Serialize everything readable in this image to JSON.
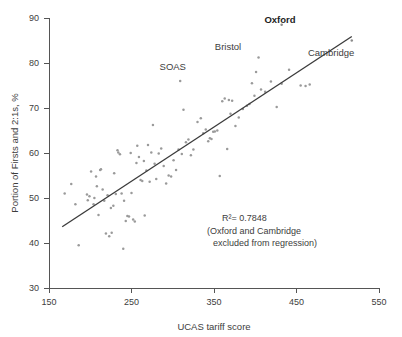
{
  "chart_data": {
    "type": "scatter",
    "title": "",
    "xlabel": "UCAS tariff score",
    "ylabel": "Portion of Firsts and 2:1s, %",
    "xlim": [
      150,
      550
    ],
    "ylim": [
      30,
      90
    ],
    "xticks": [
      150,
      250,
      350,
      450,
      550
    ],
    "yticks": [
      30,
      40,
      50,
      60,
      70,
      80,
      90
    ],
    "grid": false,
    "legend_position": "none",
    "annotations": [
      {
        "name": "r-squared",
        "text": "R²= 0.7848"
      },
      {
        "name": "exclusion-note-line1",
        "text": "(Oxford and Cambridge"
      },
      {
        "name": "exclusion-note-line2",
        "text": "excluded from regression)"
      }
    ],
    "point_labels": [
      {
        "name": "SOAS",
        "bold": false,
        "x": 300,
        "y": 78.5
      },
      {
        "name": "Bristol",
        "bold": false,
        "x": 367,
        "y": 83.0
      },
      {
        "name": "Oxford",
        "bold": true,
        "x": 430,
        "y": 89.0
      },
      {
        "name": "Cambridge",
        "bold": false,
        "x": 492,
        "y": 81.5
      }
    ],
    "regression_line": {
      "x_start": 166,
      "y_start": 43.6,
      "x_end": 517,
      "y_end": 85.9,
      "note": "Oxford and Cambridge excluded from regression"
    },
    "series": [
      {
        "name": "UK universities",
        "points": [
          [
            169,
            51.0
          ],
          [
            177,
            53.1
          ],
          [
            182,
            48.6
          ],
          [
            186,
            39.5
          ],
          [
            196,
            50.8
          ],
          [
            197,
            49.5
          ],
          [
            199,
            50.4
          ],
          [
            201,
            55.9
          ],
          [
            204,
            48.6
          ],
          [
            205,
            50.0
          ],
          [
            207,
            54.8
          ],
          [
            208,
            52.6
          ],
          [
            210,
            46.2
          ],
          [
            212,
            56.2
          ],
          [
            213,
            56.4
          ],
          [
            215,
            51.9
          ],
          [
            217,
            49.4
          ],
          [
            219,
            42.1
          ],
          [
            221,
            50.6
          ],
          [
            223,
            41.5
          ],
          [
            225,
            47.8
          ],
          [
            226,
            42.3
          ],
          [
            228,
            48.3
          ],
          [
            229,
            55.5
          ],
          [
            231,
            50.9
          ],
          [
            233,
            60.6
          ],
          [
            234,
            60.1
          ],
          [
            236,
            59.7
          ],
          [
            238,
            51.0
          ],
          [
            240,
            38.7
          ],
          [
            241,
            49.4
          ],
          [
            243,
            44.9
          ],
          [
            245,
            46.0
          ],
          [
            247,
            45.9
          ],
          [
            249,
            60.0
          ],
          [
            250,
            51.1
          ],
          [
            252,
            45.2
          ],
          [
            254,
            44.8
          ],
          [
            256,
            57.8
          ],
          [
            257,
            61.6
          ],
          [
            259,
            59.1
          ],
          [
            261,
            54.0
          ],
          [
            263,
            53.8
          ],
          [
            265,
            58.2
          ],
          [
            266,
            46.1
          ],
          [
            268,
            56.1
          ],
          [
            270,
            61.8
          ],
          [
            272,
            53.6
          ],
          [
            274,
            60.1
          ],
          [
            276,
            66.2
          ],
          [
            278,
            57.6
          ],
          [
            280,
            54.2
          ],
          [
            283,
            59.9
          ],
          [
            286,
            61.0
          ],
          [
            289,
            57.1
          ],
          [
            292,
            53.2
          ],
          [
            295,
            55.0
          ],
          [
            298,
            54.8
          ],
          [
            301,
            58.4
          ],
          [
            304,
            56.2
          ],
          [
            307,
            60.8
          ],
          [
            309,
            76.0
          ],
          [
            311,
            59.8
          ],
          [
            313,
            69.6
          ],
          [
            316,
            62.4
          ],
          [
            319,
            63.0
          ],
          [
            322,
            59.5
          ],
          [
            325,
            60.8
          ],
          [
            330,
            66.9
          ],
          [
            334,
            67.7
          ],
          [
            337,
            64.4
          ],
          [
            340,
            65.2
          ],
          [
            343,
            62.6
          ],
          [
            345,
            63.3
          ],
          [
            347,
            63.1
          ],
          [
            349,
            64.7
          ],
          [
            351,
            64.8
          ],
          [
            354,
            65.0
          ],
          [
            357,
            54.9
          ],
          [
            360,
            71.5
          ],
          [
            363,
            72.1
          ],
          [
            366,
            60.9
          ],
          [
            368,
            71.8
          ],
          [
            370,
            68.7
          ],
          [
            372,
            71.6
          ],
          [
            376,
            66.0
          ],
          [
            380,
            67.9
          ],
          [
            385,
            69.8
          ],
          [
            390,
            70.5
          ],
          [
            393,
            70.9
          ],
          [
            396,
            75.5
          ],
          [
            399,
            72.7
          ],
          [
            401,
            78.0
          ],
          [
            404,
            81.2
          ],
          [
            407,
            74.1
          ],
          [
            412,
            73.6
          ],
          [
            419,
            75.9
          ],
          [
            426,
            70.2
          ],
          [
            432,
            75.4
          ],
          [
            441,
            78.5
          ],
          [
            455,
            75.0
          ],
          [
            461,
            74.9
          ],
          [
            466,
            75.2
          ]
        ]
      },
      {
        "name": "highlighted",
        "points": [
          [
            432,
            88.5
          ],
          [
            517,
            85.0
          ]
        ]
      }
    ]
  }
}
